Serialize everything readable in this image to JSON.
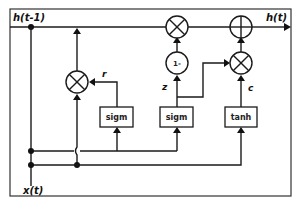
{
  "diagram": {
    "type": "GRU cell",
    "labels": {
      "input_hidden": "h(t-1)",
      "output_hidden": "h(t)",
      "input_x": "x(t)"
    },
    "gates": {
      "reset": "r",
      "update": "z",
      "candidate": "c"
    },
    "blocks": [
      {
        "id": "sigm-reset",
        "label": "sigm"
      },
      {
        "id": "sigm-update",
        "label": "sigm"
      },
      {
        "id": "tanh-candidate",
        "label": "tanh"
      }
    ],
    "operators": [
      {
        "id": "mult-reset",
        "symbol": "multiply"
      },
      {
        "id": "mult-top",
        "symbol": "multiply"
      },
      {
        "id": "one-minus",
        "symbol": "1-"
      },
      {
        "id": "mult-candidate",
        "symbol": "multiply"
      },
      {
        "id": "add-output",
        "symbol": "add"
      }
    ],
    "colors": {
      "line": "#1a1a1a",
      "background": "#ffffff"
    }
  }
}
